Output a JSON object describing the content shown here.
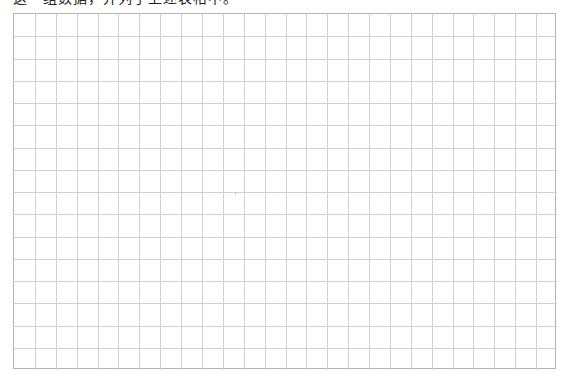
{
  "caption": {
    "text": "这一组数据，并列于上述表格中。",
    "clipped": true
  },
  "grid": {
    "columns": 26,
    "rows": 16,
    "left": 13,
    "top": 13,
    "width": 543,
    "height": 356,
    "line_color": "#d2d2d2",
    "border_color": "#b4b4b4"
  }
}
